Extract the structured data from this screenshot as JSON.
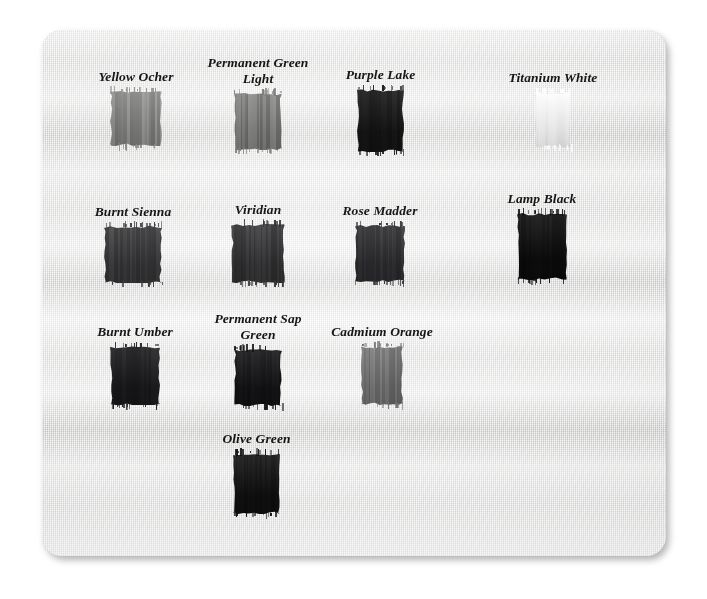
{
  "page": {
    "background_color": "#ffffff",
    "canvas_color": "#d9d9d6",
    "label_color": "#161616"
  },
  "chart_data": {
    "type": "table",
    "xlabel": "",
    "ylabel": "",
    "rows": 4,
    "columns": 4,
    "categories": [
      "Yellow Ocher",
      "Permanent Green Light",
      "Purple Lake",
      "Titanium White",
      "Burnt Sienna",
      "Viridian",
      "Rose Madder",
      "Lamp Black",
      "Burnt Umber",
      "Permanent Sap Green",
      "Cadmium Orange",
      "Olive Green"
    ],
    "values": [
      63,
      55,
      10,
      100,
      22,
      19,
      17,
      5,
      11,
      8,
      49,
      6
    ],
    "value_units": "relative lightness (0 = black, 100 = white)",
    "swatches": [
      {
        "label": "Yellow Ocher",
        "label_lines": [
          "Yellow Ocher"
        ],
        "swatch_color": "#8c8c8a",
        "lightness": 63,
        "row": 1,
        "column": 1,
        "x": 110,
        "y": 90,
        "width": 52,
        "height": 56
      },
      {
        "label": "Permanent Green Light",
        "label_lines": [
          "Permanent Green",
          "Light"
        ],
        "swatch_color": "#7c7c7a",
        "lightness": 55,
        "row": 1,
        "column": 2,
        "x": 234,
        "y": 92,
        "width": 48,
        "height": 58
      },
      {
        "label": "Purple Lake",
        "label_lines": [
          "Purple Lake"
        ],
        "swatch_color": "#141414",
        "lightness": 10,
        "row": 1,
        "column": 3,
        "x": 357,
        "y": 88,
        "width": 47,
        "height": 64
      },
      {
        "label": "Titanium White",
        "label_lines": [
          "Titanium White"
        ],
        "swatch_color": "#fefefe",
        "lightness": 100,
        "row": 1,
        "column": 4,
        "x": 535,
        "y": 91,
        "width": 36,
        "height": 56
      },
      {
        "label": "Burnt Sienna",
        "label_lines": [
          "Burnt Sienna"
        ],
        "swatch_color": "#39383a",
        "lightness": 22,
        "row": 2,
        "column": 1,
        "x": 104,
        "y": 225,
        "width": 58,
        "height": 58
      },
      {
        "label": "Viridian",
        "label_lines": [
          "Viridian"
        ],
        "swatch_color": "#333335",
        "lightness": 19,
        "row": 2,
        "column": 2,
        "x": 231,
        "y": 223,
        "width": 54,
        "height": 60
      },
      {
        "label": "Rose Madder",
        "label_lines": [
          "Rose Madder"
        ],
        "swatch_color": "#2e2d30",
        "lightness": 17,
        "row": 2,
        "column": 3,
        "x": 355,
        "y": 224,
        "width": 50,
        "height": 58
      },
      {
        "label": "Lamp Black",
        "label_lines": [
          "Lamp Black"
        ],
        "swatch_color": "#0b0b0c",
        "lightness": 5,
        "row": 2,
        "column": 4,
        "x": 517,
        "y": 212,
        "width": 50,
        "height": 68
      },
      {
        "label": "Burnt Umber",
        "label_lines": [
          "Burnt Umber"
        ],
        "swatch_color": "#1a191b",
        "lightness": 11,
        "row": 3,
        "column": 1,
        "x": 110,
        "y": 345,
        "width": 50,
        "height": 60
      },
      {
        "label": "Permanent Sap Green",
        "label_lines": [
          "Permanent Sap",
          "Green"
        ],
        "swatch_color": "#131214",
        "lightness": 8,
        "row": 3,
        "column": 2,
        "x": 234,
        "y": 348,
        "width": 48,
        "height": 58
      },
      {
        "label": "Cadmium Orange",
        "label_lines": [
          "Cadmium Orange"
        ],
        "swatch_color": "#737373",
        "lightness": 49,
        "row": 3,
        "column": 3,
        "x": 361,
        "y": 345,
        "width": 42,
        "height": 60
      },
      {
        "label": "Olive Green",
        "label_lines": [
          "Olive Green"
        ],
        "swatch_color": "#0f0f10",
        "lightness": 6,
        "row": 4,
        "column": 2,
        "x": 233,
        "y": 452,
        "width": 47,
        "height": 62
      }
    ]
  }
}
